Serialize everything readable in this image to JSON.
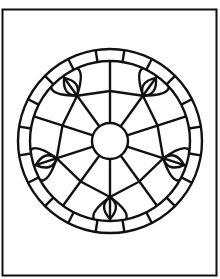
{
  "artwork": {
    "subject": "rose-window-coloring-page",
    "stroke_color": "#111111",
    "background_color": "#ffffff",
    "center": [
      110,
      141
    ],
    "outer_radius": 92,
    "inner_ring_radius": 80,
    "hub_radius": 18,
    "spokes": 10,
    "petal_motifs": 5
  }
}
